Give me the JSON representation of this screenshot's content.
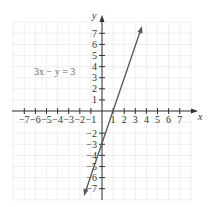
{
  "chart_data": {
    "type": "line",
    "title": "",
    "equation_label": "3x − y = 3",
    "xlabel": "x",
    "ylabel": "y",
    "xlim": [
      -7,
      7
    ],
    "ylim": [
      -7,
      7
    ],
    "grid": true,
    "x_ticks": [
      "−7",
      "−6",
      "−5",
      "−4",
      "−3",
      "−2",
      "−1",
      "1",
      "2",
      "3",
      "4",
      "5",
      "6",
      "7"
    ],
    "y_ticks": [
      "7",
      "6",
      "5",
      "4",
      "3",
      "2",
      "1",
      "−2",
      "−3",
      "−4",
      "−5",
      "−6",
      "−7"
    ],
    "series": [
      {
        "name": "3x − y = 3",
        "equation": "y = 3x − 3",
        "x": [
          -1.5,
          0,
          1,
          3.5
        ],
        "y": [
          -7.5,
          -3,
          0,
          7.5
        ]
      }
    ],
    "colors": {
      "line": "#555555",
      "grid": "#e6e6e6",
      "axis": "#333333"
    }
  }
}
